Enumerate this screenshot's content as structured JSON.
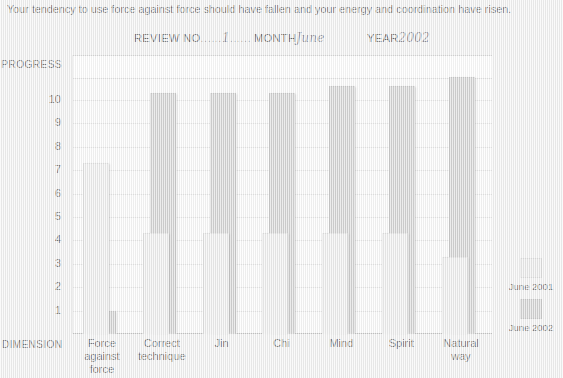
{
  "header": {
    "intro_text": "Your tendency to use force against force should have fallen and your energy and coordination have risen.",
    "fields": [
      {
        "label": "REVIEW NO",
        "dots": "......",
        "value": "1"
      },
      {
        "label": "MONTH",
        "dots": "",
        "value": "June"
      },
      {
        "label": "YEAR",
        "dots": "",
        "value": "2002"
      }
    ]
  },
  "axis": {
    "y_title": "PROGRESS",
    "x_title": "DIMENSION",
    "y_ticks": [
      "10",
      "9",
      "8",
      "7",
      "6",
      "5",
      "4",
      "3",
      "2",
      "1"
    ]
  },
  "legend": {
    "items": [
      {
        "label": "June 2001",
        "color": "#e8e8e8"
      },
      {
        "label": "June 2002",
        "color": "#c9c9c9"
      }
    ]
  },
  "chart_data": {
    "type": "bar",
    "title": "Your tendency to use force against force should have fallen and your energy and coordination have risen.",
    "xlabel": "DIMENSION",
    "ylabel": "PROGRESS",
    "ylim": [
      0,
      11
    ],
    "grid": true,
    "legend_position": "right",
    "categories": [
      "Force against force",
      "Correct technique",
      "Jin",
      "Chi",
      "Mind",
      "Spirit",
      "Natural way"
    ],
    "category_lines": [
      [
        "Force",
        "against force"
      ],
      [
        "Correct",
        "technique"
      ],
      [
        "Jin"
      ],
      [
        "Chi"
      ],
      [
        "Mind"
      ],
      [
        "Spirit"
      ],
      [
        "Natural",
        "way"
      ]
    ],
    "series": [
      {
        "name": "June 2001",
        "color": "#e8e8e8",
        "values": [
          7.3,
          4.3,
          4.3,
          4.3,
          4.3,
          4.3,
          3.3
        ]
      },
      {
        "name": "June 2002",
        "color": "#c9c9c9",
        "values": [
          1.0,
          10.3,
          10.3,
          10.3,
          10.6,
          10.6,
          11.0
        ]
      }
    ]
  }
}
